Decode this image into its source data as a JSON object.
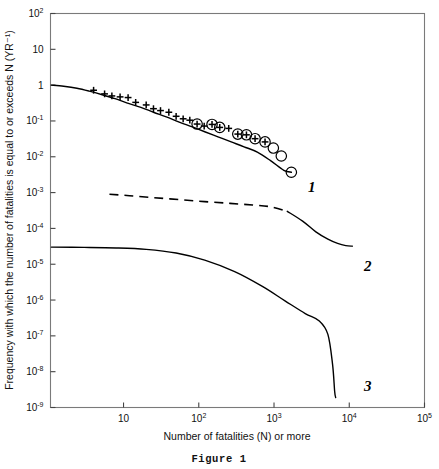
{
  "chart_data": {
    "type": "line",
    "title": "",
    "caption": "Figure 1",
    "xlabel": "Number of fatalities (N) or more",
    "ylabel": "Frequency with which the number of fatalities is equal to or exceeds N (YR⁻¹)",
    "xscale": "log",
    "yscale": "log",
    "xlim": [
      1.07,
      100000
    ],
    "ylim": [
      1e-09,
      100
    ],
    "grid": false,
    "legend": "inline-curve-labels",
    "xticks": [
      {
        "value": 10,
        "label": "10",
        "mantissa": "10",
        "exponent": ""
      },
      {
        "value": 100,
        "label": "10²",
        "mantissa": "10",
        "exponent": "2"
      },
      {
        "value": 1000,
        "label": "10³",
        "mantissa": "10",
        "exponent": "3"
      },
      {
        "value": 10000,
        "label": "10⁴",
        "mantissa": "10",
        "exponent": "4"
      },
      {
        "value": 100000,
        "label": "10⁵",
        "mantissa": "10",
        "exponent": "5"
      }
    ],
    "yticks": [
      {
        "value": 100,
        "label": "10²",
        "mantissa": "10",
        "exponent": "2"
      },
      {
        "value": 10,
        "label": "10",
        "mantissa": "10",
        "exponent": ""
      },
      {
        "value": 1,
        "label": "1",
        "mantissa": "1",
        "exponent": ""
      },
      {
        "value": 0.1,
        "label": "10⁻¹",
        "mantissa": "10",
        "exponent": "-1"
      },
      {
        "value": 0.01,
        "label": "10⁻²",
        "mantissa": "10",
        "exponent": "-2"
      },
      {
        "value": 0.001,
        "label": "10⁻³",
        "mantissa": "10",
        "exponent": "-3"
      },
      {
        "value": 0.0001,
        "label": "10⁻⁴",
        "mantissa": "10",
        "exponent": "-4"
      },
      {
        "value": 1e-05,
        "label": "10⁻⁵",
        "mantissa": "10",
        "exponent": "-5"
      },
      {
        "value": 1e-06,
        "label": "10⁻⁶",
        "mantissa": "10",
        "exponent": "-6"
      },
      {
        "value": 1e-07,
        "label": "10⁻⁷",
        "mantissa": "10",
        "exponent": "-7"
      },
      {
        "value": 1e-08,
        "label": "10⁻⁸",
        "mantissa": "10",
        "exponent": "-8"
      },
      {
        "value": 1e-09,
        "label": "10⁻⁹",
        "mantissa": "10",
        "exponent": "-9"
      }
    ],
    "series": [
      {
        "name": "1",
        "label": "1",
        "style": "solid",
        "label_x": 2300,
        "label_y": 0.0022,
        "x": [
          1.1,
          1.6,
          2.4,
          3.5,
          5.2,
          7.7,
          11,
          17,
          25,
          37,
          55,
          82,
          120,
          180,
          270,
          400,
          600,
          900,
          1350,
          1700
        ],
        "y": [
          1.0,
          0.93,
          0.82,
          0.68,
          0.54,
          0.42,
          0.32,
          0.24,
          0.175,
          0.13,
          0.093,
          0.068,
          0.05,
          0.036,
          0.026,
          0.019,
          0.0135,
          0.0078,
          0.0042,
          0.0037
        ]
      },
      {
        "name": "2",
        "label": "2",
        "style": "dashed-then-solid",
        "label_x": 13000,
        "label_y": 4.8e-05,
        "x": [
          6.5,
          12,
          25,
          55,
          120,
          260,
          520,
          900,
          1500,
          2400,
          3600,
          5200,
          7000,
          9000,
          11000
        ],
        "y": [
          0.0009,
          0.00082,
          0.00072,
          0.00064,
          0.00056,
          0.0005,
          0.00045,
          0.0004,
          0.0003,
          0.00016,
          8e-05,
          5e-05,
          3.8e-05,
          3.3e-05,
          3.2e-05
        ],
        "dash_end_x": 1500
      },
      {
        "name": "3",
        "label": "3",
        "style": "solid",
        "label_x": 13000,
        "label_y": 2.6e-09,
        "x": [
          1.1,
          3,
          8,
          20,
          50,
          120,
          300,
          700,
          1400,
          2600,
          4000,
          5200,
          6000,
          6400,
          6600
        ],
        "y": [
          3e-05,
          2.95e-05,
          2.85e-05,
          2.6e-05,
          2.05e-05,
          1.3e-05,
          6.2e-06,
          2.4e-06,
          9.5e-07,
          4.2e-07,
          2.6e-07,
          1.1e-07,
          1.6e-08,
          2.8e-09,
          1.9e-09
        ]
      }
    ],
    "markers": {
      "plus": {
        "symbol": "+",
        "count": 22,
        "x": [
          4.0,
          5.6,
          7.0,
          9.0,
          11.5,
          14.5,
          20,
          25,
          31,
          40,
          50,
          62,
          76,
          95,
          118,
          150,
          190,
          250,
          330,
          430,
          560,
          760
        ],
        "y": [
          0.72,
          0.57,
          0.5,
          0.47,
          0.45,
          0.33,
          0.28,
          0.22,
          0.195,
          0.175,
          0.135,
          0.115,
          0.105,
          0.082,
          0.072,
          0.08,
          0.066,
          0.062,
          0.043,
          0.041,
          0.032,
          0.026
        ]
      },
      "circled_plus": {
        "symbol": "⊕",
        "count": 10,
        "x": [
          95,
          150,
          190,
          330,
          430,
          560,
          760,
          980,
          1250,
          1700
        ],
        "y": [
          0.082,
          0.08,
          0.066,
          0.043,
          0.041,
          0.032,
          0.026,
          0.0175,
          0.0105,
          0.0037
        ]
      }
    }
  }
}
